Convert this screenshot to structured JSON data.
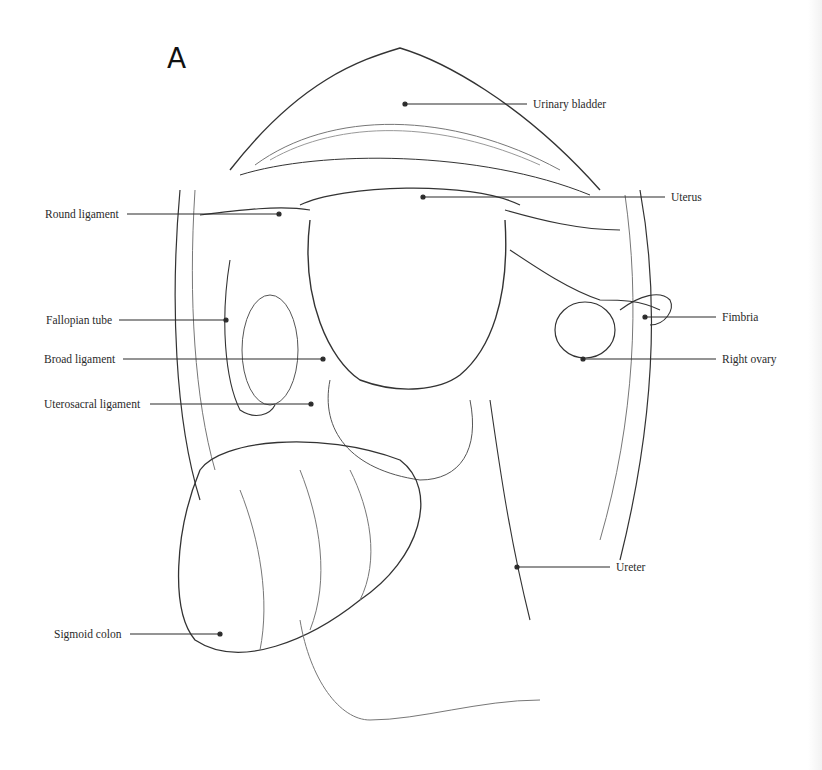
{
  "figure": {
    "panel_letter": "A",
    "labels": {
      "urinary_bladder": "Urinary bladder",
      "uterus": "Uterus",
      "round_ligament": "Round ligament",
      "fallopian_tube": "Fallopian tube",
      "fimbria": "Fimbria",
      "broad_ligament": "Broad ligament",
      "right_ovary": "Right ovary",
      "uterosacral_ligament": "Uterosacral ligament",
      "ureter": "Ureter",
      "sigmoid_colon": "Sigmoid colon"
    }
  }
}
